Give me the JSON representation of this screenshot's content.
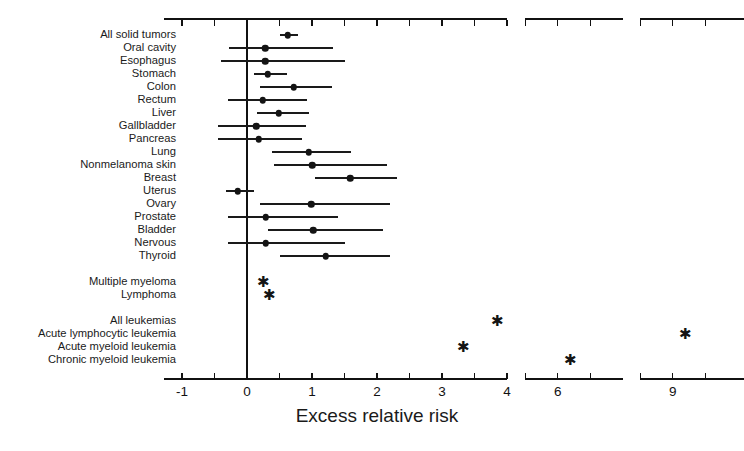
{
  "chart_data": {
    "type": "scatter",
    "title": "",
    "xlabel": "Excess relative risk",
    "ylabel": "",
    "grid": false,
    "legend": null,
    "axis_note": "Broken x-axis: continuous segment -1 to 4, then a gap, segment 5.5 to 7, then gap, segment 8.5 to 10",
    "x_ticks": [
      {
        "label": "-1",
        "value": -1
      },
      {
        "label": "",
        "value": -0.5
      },
      {
        "label": "0",
        "value": 0
      },
      {
        "label": "",
        "value": 0.5
      },
      {
        "label": "1",
        "value": 1
      },
      {
        "label": "",
        "value": 1.5
      },
      {
        "label": "2",
        "value": 2
      },
      {
        "label": "",
        "value": 2.5
      },
      {
        "label": "3",
        "value": 3
      },
      {
        "label": "",
        "value": 3.5
      },
      {
        "label": "4",
        "value": 4
      },
      {
        "label": "6",
        "value": 6
      },
      {
        "label": "",
        "value": 5.5
      },
      {
        "label": "",
        "value": 6.5
      },
      {
        "label": "9",
        "value": 9
      },
      {
        "label": "",
        "value": 8.5
      },
      {
        "label": "",
        "value": 9.5
      }
    ],
    "reference_line": 0,
    "marker_note": "Filled circle = point estimate with horizontal 95% CI line; asterisk = estimate shown without CI",
    "categories": [
      {
        "label": "All solid tumors",
        "estimate": 0.63,
        "ci_low": 0.5,
        "ci_high": 0.78,
        "marker": "dot"
      },
      {
        "label": "Oral cavity",
        "estimate": 0.28,
        "ci_low": -0.28,
        "ci_high": 1.32,
        "marker": "dot"
      },
      {
        "label": "Esophagus",
        "estimate": 0.28,
        "ci_low": -0.4,
        "ci_high": 1.5,
        "marker": "dot"
      },
      {
        "label": "Stomach",
        "estimate": 0.32,
        "ci_low": 0.1,
        "ci_high": 0.62,
        "marker": "dot"
      },
      {
        "label": "Colon",
        "estimate": 0.72,
        "ci_low": 0.2,
        "ci_high": 1.3,
        "marker": "dot"
      },
      {
        "label": "Rectum",
        "estimate": 0.24,
        "ci_low": -0.3,
        "ci_high": 0.92,
        "marker": "dot"
      },
      {
        "label": "Liver",
        "estimate": 0.49,
        "ci_low": 0.16,
        "ci_high": 0.95,
        "marker": "dot"
      },
      {
        "label": "Gallbladder",
        "estimate": 0.14,
        "ci_low": -0.45,
        "ci_high": 0.9,
        "marker": "dot"
      },
      {
        "label": "Pancreas",
        "estimate": 0.18,
        "ci_low": -0.45,
        "ci_high": 0.85,
        "marker": "dot"
      },
      {
        "label": "Lung",
        "estimate": 0.95,
        "ci_low": 0.38,
        "ci_high": 1.6,
        "marker": "dot"
      },
      {
        "label": "Nonmelanoma skin",
        "estimate": 1.0,
        "ci_low": 0.42,
        "ci_high": 2.15,
        "marker": "dot"
      },
      {
        "label": "Breast",
        "estimate": 1.59,
        "ci_low": 1.05,
        "ci_high": 2.3,
        "marker": "dot"
      },
      {
        "label": "Uterus",
        "estimate": -0.14,
        "ci_low": -0.33,
        "ci_high": 0.11,
        "marker": "dot"
      },
      {
        "label": "Ovary",
        "estimate": 0.99,
        "ci_low": 0.2,
        "ci_high": 2.2,
        "marker": "dot"
      },
      {
        "label": "Prostate",
        "estimate": 0.29,
        "ci_low": -0.3,
        "ci_high": 1.4,
        "marker": "dot"
      },
      {
        "label": "Bladder",
        "estimate": 1.02,
        "ci_low": 0.32,
        "ci_high": 2.1,
        "marker": "dot"
      },
      {
        "label": "Nervous",
        "estimate": 0.29,
        "ci_low": -0.3,
        "ci_high": 1.5,
        "marker": "dot"
      },
      {
        "label": "Thyroid",
        "estimate": 1.21,
        "ci_low": 0.51,
        "ci_high": 2.2,
        "marker": "dot"
      },
      {
        "label": "",
        "estimate": null,
        "ci_low": null,
        "ci_high": null,
        "marker": "none"
      },
      {
        "label": "Multiple myeloma",
        "estimate": 0.26,
        "ci_low": null,
        "ci_high": null,
        "marker": "star"
      },
      {
        "label": "Lymphoma",
        "estimate": 0.35,
        "ci_low": null,
        "ci_high": null,
        "marker": "star"
      },
      {
        "label": "",
        "estimate": null,
        "ci_low": null,
        "ci_high": null,
        "marker": "none"
      },
      {
        "label": "All leukemias",
        "estimate": 3.85,
        "ci_low": null,
        "ci_high": null,
        "marker": "star"
      },
      {
        "label": "Acute lymphocytic leukemia",
        "estimate": 9.2,
        "ci_low": null,
        "ci_high": null,
        "marker": "star"
      },
      {
        "label": "Acute myeloid leukemia",
        "estimate": 3.33,
        "ci_low": null,
        "ci_high": null,
        "marker": "star"
      },
      {
        "label": "Chronic myeloid leukemia",
        "estimate": 6.2,
        "ci_low": null,
        "ci_high": null,
        "marker": "star"
      }
    ]
  },
  "colors": {
    "marker": "#141414",
    "axis": "#111111",
    "text": "#1a1a1a",
    "background": "#ffffff"
  }
}
